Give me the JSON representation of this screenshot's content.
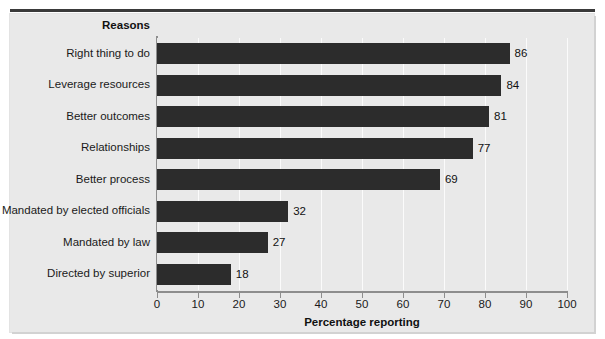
{
  "figure": {
    "clipped_caption": "",
    "panel_bg": "#e9e9e9",
    "bar_color": "#2c2c2c",
    "grid_color": "#fbfbfb",
    "axis_color": "#8d8d8d",
    "text_color": "#1a1a1a"
  },
  "legend_header": "Reasons",
  "chart_data": {
    "type": "bar",
    "orientation": "horizontal",
    "title": "",
    "subtitle": "",
    "xlabel": "Percentage reporting",
    "ylabel": "Reasons",
    "xlim": [
      0,
      100
    ],
    "xticks": [
      0,
      10,
      20,
      30,
      40,
      50,
      60,
      70,
      80,
      90,
      100
    ],
    "xticklabels": [
      "0",
      "10",
      "20",
      "30",
      "40",
      "50",
      "60",
      "70",
      "80",
      "90",
      "100"
    ],
    "grid": "vertical",
    "legend": "none",
    "categories": [
      "Right thing to do",
      "Leverage resources",
      "Better outcomes",
      "Relationships",
      "Better process",
      "Mandated by elected officials",
      "Mandated by law",
      "Directed by superior"
    ],
    "values": [
      86,
      84,
      81,
      77,
      69,
      32,
      27,
      18
    ],
    "value_labels": [
      "86",
      "84",
      "81",
      "77",
      "69",
      "32",
      "27",
      "18"
    ],
    "bar_color": "#2c2c2c"
  }
}
